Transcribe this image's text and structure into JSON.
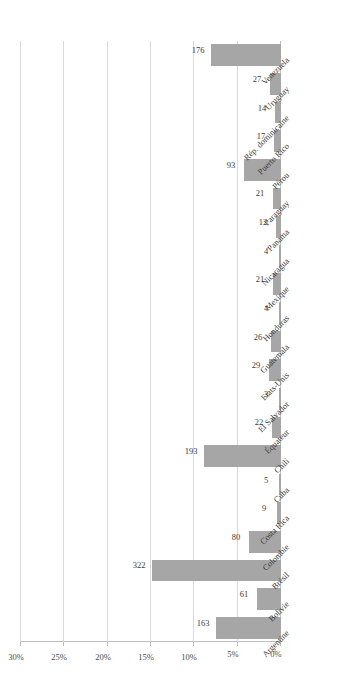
{
  "chart_data": {
    "type": "bar",
    "orientation": "vertical-rotated",
    "title": "",
    "subtitle": "",
    "xlabel": "",
    "ylabel": "",
    "ylim": [
      0,
      30
    ],
    "yunit": "%",
    "grid": true,
    "legend": null,
    "ytick_labels": [
      "0%",
      "5%",
      "10%",
      "15%",
      "20%",
      "25%",
      "30%"
    ],
    "ytick_values": [
      0,
      5,
      10,
      15,
      20,
      25,
      30
    ],
    "value_scale_max": 650,
    "categories": [
      "Argentine",
      "Bolivie",
      "Brésil",
      "Colombie",
      "Costa Rica",
      "Cuba",
      "Chili",
      "Équateur",
      "El Salvador",
      "Etats-Unis",
      "Guatemala",
      "Honduras",
      "Mexique",
      "Nicaragua",
      "Panama",
      "Paraguay",
      "Pérou",
      "Puerto Rico",
      "Rép. dominicaine",
      "Uruguay",
      "Venezuela"
    ],
    "values": [
      163,
      61,
      322,
      80,
      9,
      5,
      193,
      22,
      3,
      29,
      26,
      4,
      21,
      4,
      12,
      21,
      93,
      17,
      14,
      27,
      176
    ],
    "data_labels": [
      "163",
      "61",
      "322",
      "80",
      "9",
      "5",
      "193",
      "22",
      "3",
      "29",
      "26",
      "4",
      "21",
      "4",
      "12",
      "21",
      "93",
      "17",
      "14",
      "27",
      "176"
    ]
  },
  "colors": {
    "bar": "#a6a6a6",
    "grid": "#d9d9d9",
    "axis": "#bfbfbf",
    "text": "#3c3c3c",
    "background": "#ffffff"
  }
}
